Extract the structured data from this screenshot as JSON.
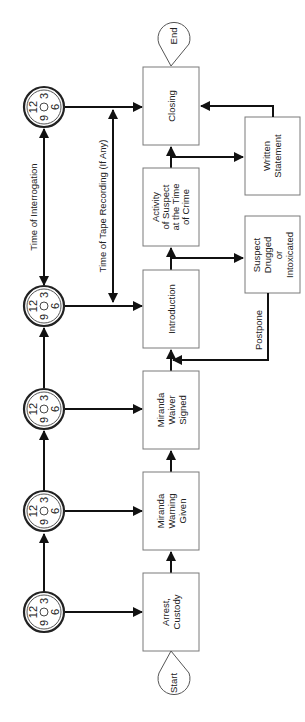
{
  "diagram": {
    "orientation": "rotated 90 degrees counter-clockwise",
    "terminators": {
      "start": "Start",
      "end": "End"
    },
    "process_steps": [
      {
        "id": "arrest",
        "lines": [
          "Arrest,",
          "Custody"
        ]
      },
      {
        "id": "miranda-warning",
        "lines": [
          "Miranda",
          "Warning",
          "Given"
        ]
      },
      {
        "id": "miranda-waiver",
        "lines": [
          "Miranda",
          "Waiver",
          "Signed"
        ]
      },
      {
        "id": "introduction",
        "lines": [
          "Introduction"
        ]
      },
      {
        "id": "activity",
        "lines": [
          "Activity",
          "of Suspect",
          "at the Time",
          "of Crime"
        ]
      },
      {
        "id": "closing",
        "lines": [
          "Closing"
        ]
      }
    ],
    "side_steps": [
      {
        "id": "suspect-drugged",
        "lines": [
          "Suspect",
          "Drugged",
          "or",
          "Intoxicated"
        ]
      },
      {
        "id": "written-statement",
        "lines": [
          "Written",
          "Statement"
        ]
      }
    ],
    "clock_labels": {
      "twelve": "12",
      "three": "3",
      "six": "6",
      "nine": "9"
    },
    "clock_count": 5,
    "annotations": {
      "time_of_interrogation": "Time of Interrogation",
      "time_of_tape_recording": "Time of Tape Recording (If Any)",
      "postpone": "Postpone"
    },
    "colors": {
      "line": "#111111",
      "box_border": "#7a7a7a",
      "background": "#ffffff"
    }
  }
}
